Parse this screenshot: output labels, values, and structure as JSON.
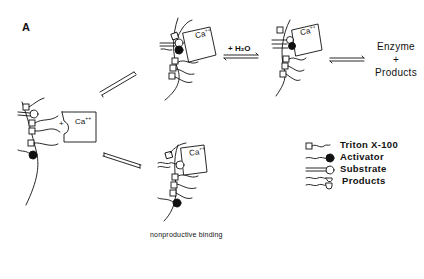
{
  "figure": {
    "panel_label": "A",
    "calcium_label": "Ca",
    "calcium_charge": "++",
    "plus_sign": "+",
    "water_label": "+ H₂O",
    "products_state": {
      "line1": "Enzyme",
      "line2": "+",
      "line3": "Products"
    },
    "caption_nonproductive": "nonproductive  binding"
  },
  "legend": {
    "items": [
      {
        "icon": "triton-x100-icon",
        "label": "Triton  X-100"
      },
      {
        "icon": "activator-icon",
        "label": "Activator"
      },
      {
        "icon": "substrate-icon",
        "label": "Substrate"
      },
      {
        "icon": "products-icon",
        "label": "Products"
      }
    ]
  },
  "colors": {
    "ink": "#111111",
    "background": "#ffffff"
  }
}
